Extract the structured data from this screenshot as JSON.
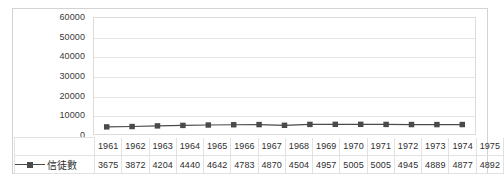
{
  "chart_data": {
    "type": "line",
    "title": "",
    "xlabel": "",
    "ylabel": "",
    "ylim": [
      0,
      60000
    ],
    "grid": true,
    "legend_position": "bottom-left-table",
    "marker": "square",
    "series_color": "#4a4a4a",
    "categories": [
      "1961",
      "1962",
      "1963",
      "1964",
      "1965",
      "1966",
      "1967",
      "1968",
      "1969",
      "1970",
      "1971",
      "1972",
      "1973",
      "1974",
      "1975"
    ],
    "series": [
      {
        "name": "信徒數",
        "values": [
          3675,
          3872,
          4204,
          4440,
          4642,
          4783,
          4870,
          4504,
          4957,
          5005,
          5005,
          4945,
          4889,
          4877,
          4892
        ]
      }
    ],
    "y_ticks": [
      "0",
      "10000",
      "20000",
      "30000",
      "40000",
      "50000",
      "60000"
    ],
    "y_tick_values": [
      0,
      10000,
      20000,
      30000,
      40000,
      50000,
      60000
    ]
  },
  "table": {
    "legend_blank": "",
    "series_label": "信徒數"
  }
}
